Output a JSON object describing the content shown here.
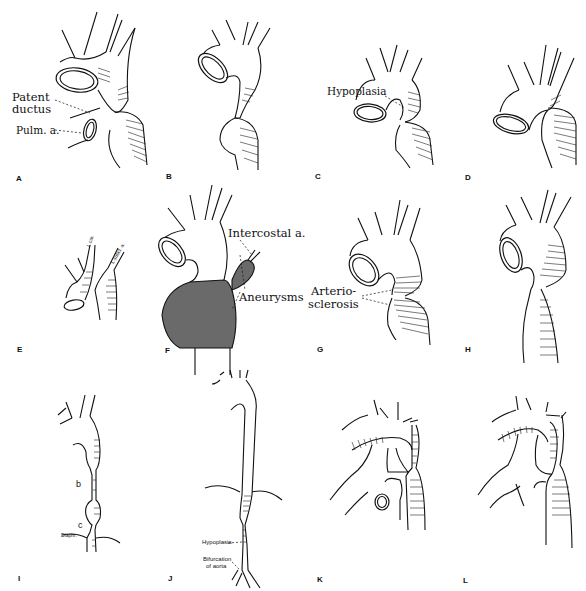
{
  "figure": {
    "panels": [
      {
        "letter": "A",
        "labels": [
          "Patent",
          "ductus",
          "Pulm. a."
        ]
      },
      {
        "letter": "B",
        "labels": []
      },
      {
        "letter": "C",
        "labels": [
          "Hypoplasia"
        ]
      },
      {
        "letter": "D",
        "labels": []
      },
      {
        "letter": "E",
        "labels": [
          "L.car.",
          "L.subcl. a."
        ]
      },
      {
        "letter": "F",
        "labels": [
          "Intercostal a.",
          "Aneurysms"
        ]
      },
      {
        "letter": "G",
        "labels": [
          "Arterio-",
          "sclerosis"
        ]
      },
      {
        "letter": "H",
        "labels": []
      },
      {
        "letter": "I",
        "labels": [
          "b",
          "c",
          "Diaphr."
        ]
      },
      {
        "letter": "J",
        "labels": [
          "Hypoplasia",
          "Bifurcation",
          "of aorta"
        ]
      },
      {
        "letter": "K",
        "labels": []
      },
      {
        "letter": "L",
        "labels": []
      }
    ]
  }
}
